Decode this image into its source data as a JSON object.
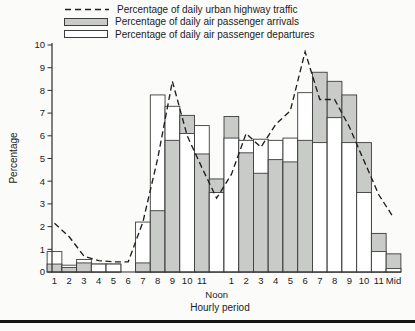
{
  "legend": [
    {
      "label": "Percentage of daily urban highway traffic",
      "swatch": "dashed-line-swatch"
    },
    {
      "label": "Percentage of daily air passenger arrivals",
      "swatch": "gray-bar-swatch"
    },
    {
      "label": "Percentage of daily air passenger departures",
      "swatch": "white-bar-swatch"
    }
  ],
  "axes": {
    "y_label": "Percentage",
    "x_label": "Hourly period",
    "noon_label": "Noon"
  },
  "colors": {
    "arrivals_fill": "#c9cbc8",
    "departures_fill": "#ffffff",
    "bar_stroke": "#3c3c3c",
    "line_color": "#1f1f1f",
    "axis_color": "#2e2e2e"
  },
  "chart_data": {
    "type": "bar",
    "title": "",
    "xlabel": "Hourly period",
    "ylabel": "Percentage",
    "ylim": [
      0,
      10
    ],
    "y_ticks": [
      0,
      1,
      2,
      3,
      4,
      5,
      6,
      7,
      8,
      9,
      10
    ],
    "grid": false,
    "legend_position": "top-left",
    "categories": [
      "1",
      "2",
      "3",
      "4",
      "5",
      "6",
      "7",
      "8",
      "9",
      "10",
      "11",
      "Noon",
      "1",
      "2",
      "3",
      "4",
      "5",
      "6",
      "7",
      "8",
      "9",
      "10",
      "11",
      "Mid"
    ],
    "series": [
      {
        "name": "Percentage of daily urban highway traffic",
        "type": "line",
        "style": "dashed",
        "values": [
          2.15,
          1.55,
          0.7,
          0.5,
          0.45,
          0.45,
          2.2,
          5.0,
          8.4,
          6.0,
          4.6,
          3.25,
          4.3,
          6.1,
          5.5,
          6.5,
          7.1,
          9.7,
          7.6,
          7.6,
          6.4,
          4.9,
          3.4,
          2.4
        ]
      },
      {
        "name": "Percentage of daily air passenger arrivals",
        "type": "bar",
        "values": [
          0.35,
          0.2,
          0.4,
          0.35,
          0.35,
          0,
          0.4,
          2.7,
          5.8,
          6.9,
          5.2,
          4.1,
          6.85,
          5.25,
          4.35,
          4.95,
          4.85,
          5.8,
          8.8,
          8.4,
          7.8,
          5.7,
          1.7,
          0.8
        ]
      },
      {
        "name": "Percentage of daily air passenger departures",
        "type": "bar",
        "values": [
          0.9,
          0.3,
          0.55,
          0.35,
          0.35,
          0,
          2.2,
          7.8,
          7.3,
          6.1,
          6.45,
          3.5,
          5.9,
          5.8,
          5.85,
          5.8,
          5.9,
          7.9,
          5.7,
          6.8,
          5.7,
          3.5,
          0.9,
          0.15
        ]
      }
    ],
    "bar_mode": "overlapped",
    "note_visible_on_chart": ""
  }
}
